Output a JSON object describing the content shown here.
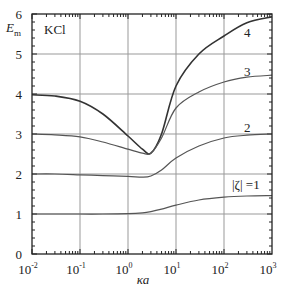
{
  "chart_data": {
    "type": "line",
    "title": "",
    "xlabel": "κa",
    "ylabel": "E_m",
    "xscale": "log",
    "xlim": [
      0.01,
      1000
    ],
    "ylim": [
      0,
      6
    ],
    "grid": true,
    "annotations": [
      {
        "text": "KCl",
        "x": 0.02,
        "y": 5.5
      },
      {
        "text": "4",
        "x": 250,
        "y": 5.6
      },
      {
        "text": "3",
        "x": 250,
        "y": 4.6
      },
      {
        "text": "2",
        "x": 250,
        "y": 3.2
      },
      {
        "text": "|ζ| =1",
        "x": 250,
        "y": 1.8
      }
    ],
    "x_ticks": [
      "10^-2",
      "10^-1",
      "10^0",
      "10^1",
      "10^2",
      "10^3"
    ],
    "y_ticks": [
      "0",
      "1",
      "2",
      "3",
      "4",
      "5",
      "6"
    ],
    "series": [
      {
        "name": "|ζ| = 4",
        "label": "4",
        "x": [
          0.01,
          0.03,
          0.1,
          0.3,
          1,
          2,
          3,
          5,
          10,
          30,
          100,
          300,
          1000
        ],
        "y": [
          3.98,
          3.95,
          3.82,
          3.5,
          2.95,
          2.62,
          2.52,
          3.0,
          4.2,
          5.0,
          5.45,
          5.78,
          5.93
        ]
      },
      {
        "name": "|ζ| = 3",
        "label": "3",
        "x": [
          0.01,
          0.03,
          0.1,
          0.3,
          1,
          2,
          3,
          5,
          10,
          30,
          100,
          300,
          1000
        ],
        "y": [
          3.0,
          2.98,
          2.93,
          2.8,
          2.62,
          2.52,
          2.52,
          2.9,
          3.65,
          4.05,
          4.3,
          4.42,
          4.47
        ]
      },
      {
        "name": "|ζ| = 2",
        "label": "2",
        "x": [
          0.01,
          0.03,
          0.1,
          0.3,
          1,
          2,
          3,
          5,
          10,
          30,
          100,
          300,
          1000
        ],
        "y": [
          2.0,
          2.0,
          1.98,
          1.96,
          1.94,
          1.92,
          1.95,
          2.1,
          2.4,
          2.7,
          2.9,
          2.97,
          3.0
        ]
      },
      {
        "name": "|ζ| = 1",
        "label": "|ζ| =1",
        "x": [
          0.01,
          0.03,
          0.1,
          0.3,
          1,
          2,
          3,
          5,
          10,
          30,
          100,
          300,
          1000
        ],
        "y": [
          1.0,
          1.0,
          1.0,
          1.0,
          1.01,
          1.03,
          1.06,
          1.12,
          1.22,
          1.35,
          1.42,
          1.45,
          1.46
        ]
      }
    ]
  },
  "labels": {
    "ylabel_main": "E",
    "ylabel_sub": "m",
    "xlabel": "κa",
    "electrolyte": "KCl",
    "curve4": "4",
    "curve3": "3",
    "curve2": "2",
    "curve1": "|ζ| =1"
  }
}
